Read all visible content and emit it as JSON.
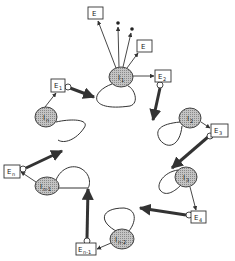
{
  "diagram": {
    "type": "cyclic state diagram",
    "colors": {
      "node_fill": "#b8b8b8",
      "stroke": "#333333",
      "background": "#ffffff"
    },
    "nodes": [
      {
        "id": "I1",
        "label": "I",
        "sub": "1",
        "cx": 121,
        "cy": 77
      },
      {
        "id": "I2",
        "label": "I",
        "sub": "2",
        "cx": 190,
        "cy": 118
      },
      {
        "id": "I3",
        "label": "I",
        "sub": "3",
        "cx": 186,
        "cy": 177
      },
      {
        "id": "In-2",
        "label": "I",
        "sub": "n-2",
        "cx": 122,
        "cy": 239
      },
      {
        "id": "In-1",
        "label": "I",
        "sub": "n-1",
        "cx": 47,
        "cy": 186
      },
      {
        "id": "In",
        "label": "I",
        "sub": "n",
        "cx": 46,
        "cy": 117
      }
    ],
    "boxes": [
      {
        "id": "E-top-left",
        "label": "E",
        "sub": "",
        "x": 88,
        "y": 7,
        "w": 15,
        "h": 12
      },
      {
        "id": "E-top-right",
        "label": "E",
        "sub": "",
        "x": 137,
        "y": 40,
        "w": 15,
        "h": 12
      },
      {
        "id": "E1",
        "label": "E",
        "sub": "1",
        "x": 51,
        "y": 79,
        "w": 14,
        "h": 13
      },
      {
        "id": "E2",
        "label": "E",
        "sub": "2",
        "x": 155,
        "y": 70,
        "w": 16,
        "h": 12
      },
      {
        "id": "E3",
        "label": "E",
        "sub": "3",
        "x": 211,
        "y": 124,
        "w": 17,
        "h": 13
      },
      {
        "id": "E4",
        "label": "E",
        "sub": "4",
        "x": 191,
        "y": 211,
        "w": 15,
        "h": 12
      },
      {
        "id": "En-1",
        "label": "E",
        "sub": "n-1",
        "x": 76,
        "y": 243,
        "w": 20,
        "h": 12
      },
      {
        "id": "En",
        "label": "E",
        "sub": "n",
        "x": 4,
        "y": 165,
        "w": 16,
        "h": 13
      }
    ]
  }
}
